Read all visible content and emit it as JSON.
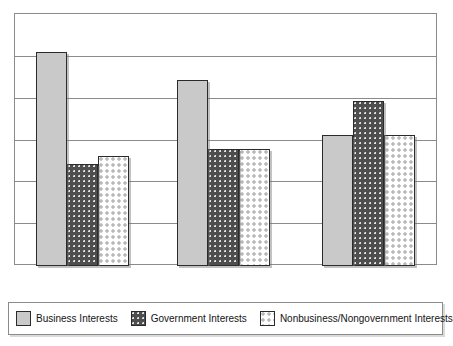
{
  "chart_data": {
    "type": "bar",
    "title": "",
    "subtitle": "",
    "xlabel": "",
    "ylabel": "",
    "categories": [
      "Group 1",
      "Group 2",
      "Group 3"
    ],
    "tick_labels": {
      "x": [],
      "y": []
    },
    "ylim": [
      0,
      6
    ],
    "grid": true,
    "grid_axis": "y",
    "gridline_count": 7,
    "legend_position": "bottom",
    "series": [
      {
        "name": "Business Interests",
        "color": "#c9c9c9",
        "pattern": "solid",
        "values": [
          5.12,
          4.45,
          3.14
        ]
      },
      {
        "name": "Government Interests",
        "color": "#4e4e4e",
        "pattern": "dotted-dark",
        "values": [
          2.43,
          2.79,
          3.95
        ]
      },
      {
        "name": "Nonbusiness/Nongovernment Interests",
        "color": "#ffffff",
        "pattern": "dotted-light-grid",
        "values": [
          2.62,
          2.79,
          3.14
        ]
      }
    ]
  },
  "legend": {
    "items": [
      {
        "label": "Business Interests"
      },
      {
        "label": "Government Interests"
      },
      {
        "label": "Nonbusiness/Nongovernment Interests"
      }
    ]
  },
  "colors": {
    "frame": "#8b8b8b",
    "gridline": "#8b8b8b",
    "bar_border": "#2b2b2b",
    "background": "#ffffff",
    "text": "#141414"
  }
}
